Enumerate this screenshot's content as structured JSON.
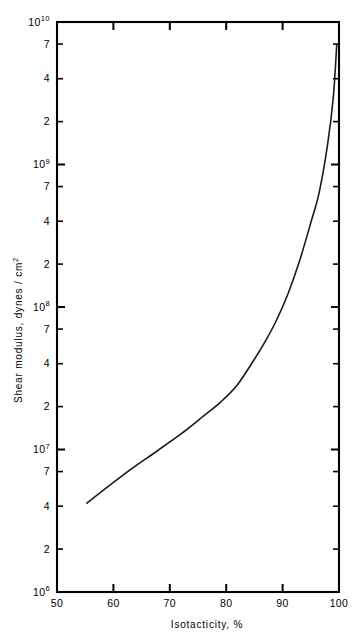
{
  "chart_data": {
    "type": "line",
    "title": "",
    "xlabel": "Isotacticity, %",
    "ylabel": "Shear modulus, dynes / cm2",
    "ylabel_display": "Shear modulus, dynes / cm",
    "ylabel_exponent": "2",
    "xlim": [
      50,
      100
    ],
    "ylim": [
      1000000,
      10000000000
    ],
    "yscale": "log",
    "xscale": "linear",
    "grid": false,
    "legend": null,
    "xticks": [
      {
        "value": 50,
        "label": "50"
      },
      {
        "value": 60,
        "label": "60"
      },
      {
        "value": 70,
        "label": "70"
      },
      {
        "value": 80,
        "label": "80"
      },
      {
        "value": 90,
        "label": "90"
      },
      {
        "value": 100,
        "label": "100"
      }
    ],
    "yticks": [
      {
        "value": 10000000000,
        "label": "10",
        "sup": "10",
        "major": true
      },
      {
        "value": 7000000000,
        "label": "7",
        "sup": "",
        "major": false
      },
      {
        "value": 4000000000,
        "label": "4",
        "sup": "",
        "major": false
      },
      {
        "value": 2000000000,
        "label": "2",
        "sup": "",
        "major": false
      },
      {
        "value": 1000000000,
        "label": "10",
        "sup": "9",
        "major": true
      },
      {
        "value": 700000000,
        "label": "7",
        "sup": "",
        "major": false
      },
      {
        "value": 400000000,
        "label": "4",
        "sup": "",
        "major": false
      },
      {
        "value": 200000000,
        "label": "2",
        "sup": "",
        "major": false
      },
      {
        "value": 100000000,
        "label": "10",
        "sup": "8",
        "major": true
      },
      {
        "value": 70000000,
        "label": "7",
        "sup": "",
        "major": false
      },
      {
        "value": 40000000,
        "label": "4",
        "sup": "",
        "major": false
      },
      {
        "value": 20000000,
        "label": "2",
        "sup": "",
        "major": false
      },
      {
        "value": 10000000,
        "label": "10",
        "sup": "7",
        "major": true
      },
      {
        "value": 7000000,
        "label": "7",
        "sup": "",
        "major": false
      },
      {
        "value": 4000000,
        "label": "4",
        "sup": "",
        "major": false
      },
      {
        "value": 2000000,
        "label": "2",
        "sup": "",
        "major": false
      },
      {
        "value": 1000000,
        "label": "10",
        "sup": "6",
        "major": true
      }
    ],
    "series": [
      {
        "name": "shear modulus vs isotacticity",
        "x": [
          55.3,
          58.0,
          61.0,
          64.0,
          67.0,
          70.0,
          73.0,
          76.0,
          79.0,
          82.0,
          85.0,
          87.0,
          89.0,
          91.0,
          93.0,
          95.0,
          96.5,
          98.0,
          99.0,
          99.6
        ],
        "y": [
          4200000.0,
          5100000.0,
          6300000.0,
          7700000.0,
          9300000.0,
          11300000.0,
          13800000.0,
          17200000.0,
          21500000.0,
          28500000.0,
          43000000.0,
          58000000.0,
          82000000.0,
          125000000.0,
          210000000.0,
          390000000.0,
          640000000.0,
          1400000000.0,
          3000000000.0,
          6900000000.0
        ]
      }
    ]
  }
}
